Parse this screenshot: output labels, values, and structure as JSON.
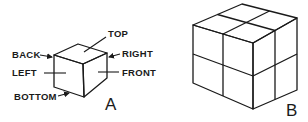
{
  "figure": {
    "panels": [
      {
        "id": "A",
        "caption": "A",
        "description": "Single cube with face labels",
        "labels": {
          "top": "TOP",
          "back": "BACK",
          "right": "RIGHT",
          "left": "LEFT",
          "front": "FRONT",
          "bottom": "BOTTOM"
        }
      },
      {
        "id": "B",
        "caption": "B",
        "description": "2x2x2 cube subdivided into eight smaller cubes"
      }
    ],
    "colors": {
      "line": "#1a1a1a",
      "background": "#ffffff"
    }
  }
}
